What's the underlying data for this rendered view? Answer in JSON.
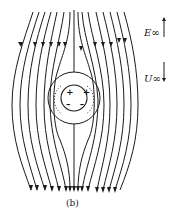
{
  "figure": {
    "caption": "(b)",
    "stroke_color": "#1a1a1a",
    "background": "#ffffff"
  },
  "labels": {
    "field": "E∞",
    "velocity": "U∞"
  },
  "drop": {
    "charges_top": "+ +",
    "charges_bottom": "– –"
  },
  "legend_arrows": [
    {
      "name": "E∞",
      "direction": "up"
    },
    {
      "name": "U∞",
      "direction": "down"
    }
  ]
}
